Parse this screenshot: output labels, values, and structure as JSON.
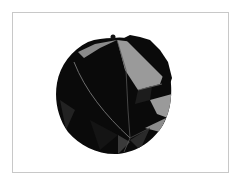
{
  "image": {
    "subject": "polyhedral-sphere-render",
    "frame_border_color": "#c8c8c8",
    "background_color": "#ffffff",
    "colors": {
      "dark_face": "#0a0a0a",
      "mid_face": "#2a2a2a",
      "light_face": "#9a9a9a",
      "edge_line": "#6e6e6e"
    }
  }
}
